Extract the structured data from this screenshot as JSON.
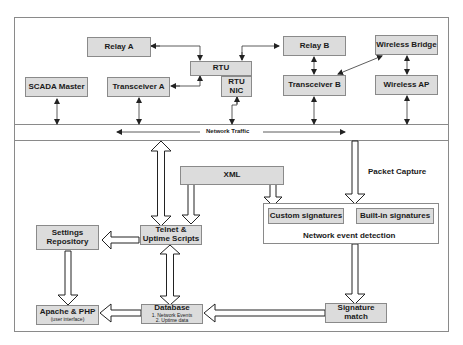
{
  "diagram": {
    "top_section": {
      "nodes": {
        "relay_a": "Relay A",
        "rtu": "RTU",
        "rtu_nic_line1": "RTU",
        "rtu_nic_line2": "NIC",
        "relay_b": "Relay B",
        "wireless_bridge": "Wireless Bridge",
        "scada_master": "SCADA Master",
        "transceiver_a": "Transceiver A",
        "transceiver_b": "Transceiver B",
        "wireless_ap": "Wireless AP"
      }
    },
    "network_band": {
      "label": "Network Traffic"
    },
    "bottom_section": {
      "nodes": {
        "xml": "XML",
        "settings_repository_line1": "Settings",
        "settings_repository_line2": "Repository",
        "telnet_line1": "Telnet &",
        "telnet_line2": "Uptime Scripts",
        "custom_signatures": "Custom signatures",
        "builtin_signatures": "Built-in signatures",
        "network_event_detection": "Network event detection",
        "apache_php": "Apache & PHP",
        "apache_php_sub": "(user interface)",
        "database": "Database",
        "database_item1": "1. Network Events",
        "database_item2": "2. Uptime data",
        "signature_match_line1": "Signature",
        "signature_match_line2": "match"
      },
      "labels": {
        "packet_capture": "Packet Capture"
      }
    },
    "colors": {
      "box_fill": "#dcdcdc",
      "box_border": "#8a8a8a",
      "line": "#333333",
      "frame": "#8a8a8a"
    }
  }
}
